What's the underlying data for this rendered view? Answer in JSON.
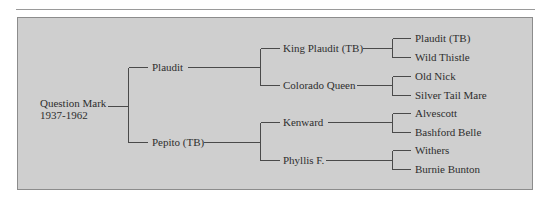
{
  "diagram": {
    "type": "pedigree-chart",
    "subject": {
      "name": "Question Mark",
      "years": "1937-1962"
    },
    "parents": {
      "sire": "Plaudit",
      "dam": "Pepito (TB)"
    },
    "grandparents": {
      "sire_sire": "King Plaudit (TB)",
      "sire_dam": "Colorado Queen",
      "dam_sire": "Kenward",
      "dam_dam": "Phyllis F."
    },
    "great_grandparents": {
      "king_plaudit_sire": "Plaudit (TB)",
      "king_plaudit_dam": "Wild Thistle",
      "colorado_queen_sire": "Old Nick",
      "colorado_queen_dam": "Silver Tail Mare",
      "kenward_sire": "Alvescott",
      "kenward_dam": "Bashford Belle",
      "phyllis_sire": "Withers",
      "phyllis_dam": "Burnie Bunton"
    },
    "colors": {
      "panel_background": "#cfcfcf",
      "panel_border": "#8c8c8c",
      "line": "#4a4a4a",
      "text": "#2e2e2e"
    }
  }
}
